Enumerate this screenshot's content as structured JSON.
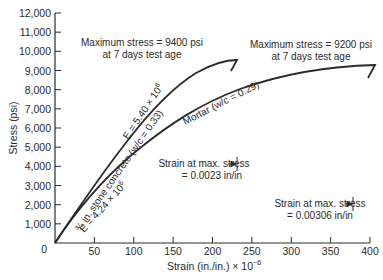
{
  "chart_data": {
    "type": "line",
    "title": "",
    "xlabel": "Strain (in./in.) × 10⁻⁶",
    "xlabel_base": "Strain (in./in.) × 10",
    "xlabel_exp": "−6",
    "ylabel": "Stress (psi)",
    "xlim": [
      0,
      400
    ],
    "ylim": [
      0,
      12000
    ],
    "grid": false,
    "x_ticks": [
      0,
      50,
      100,
      150,
      200,
      250,
      300,
      350,
      400
    ],
    "x_tick_labels": [
      "0",
      "50",
      "100",
      "150",
      "200",
      "250",
      "300",
      "350",
      "400"
    ],
    "y_ticks": [
      0,
      1000,
      2000,
      3000,
      4000,
      5000,
      6000,
      7000,
      8000,
      9000,
      10000,
      11000,
      12000
    ],
    "y_tick_labels": [
      "0",
      "1,000",
      "2,000",
      "3,000",
      "4,000",
      "5,000",
      "6,000",
      "7,000",
      "8,000",
      "9,000",
      "10,000",
      "11,000",
      "12,000"
    ],
    "series": [
      {
        "name": "3/4 in. stone concrete (w/c = 0.33)",
        "modulus_label": "E = 5.40 × 10⁶",
        "x": [
          0,
          10,
          25,
          50,
          75,
          100,
          125,
          150,
          175,
          200,
          215,
          230
        ],
        "y": [
          0,
          600,
          1300,
          2900,
          4400,
          5800,
          6900,
          7900,
          8600,
          9100,
          9300,
          9400
        ],
        "max_stress_label": "Maximum stress = 9400 psi",
        "age_label": "at 7 days test age",
        "strain_at_max_label": "Strain at max. stress",
        "strain_at_max_value": "= 0.0023 in/in"
      },
      {
        "name": "Mortar (w/c = 0.29)",
        "modulus_label": "E = 4.24 × 10⁶",
        "x": [
          0,
          10,
          25,
          50,
          75,
          100,
          125,
          150,
          175,
          200,
          250,
          300,
          340,
          365
        ],
        "y": [
          0,
          600,
          1300,
          2400,
          3500,
          4500,
          5400,
          6200,
          6800,
          7400,
          8300,
          8900,
          9100,
          9200
        ],
        "max_stress_label": "Maximum stress = 9200 psi",
        "age_label": "at 7 days test age",
        "strain_at_max_label": "Strain at max. stress",
        "strain_at_max_value": "= 0.00306 in/in"
      }
    ],
    "annotations": [
      "Maximum stress = 9400 psi at 7 days test age",
      "Maximum stress = 9200 psi at 7 days test age",
      "Strain at max. stress = 0.0023 in/in",
      "Strain at max. stress = 0.00306 in/in",
      "E = 5.40 × 10⁶",
      "E = 4.24 × 10⁶",
      "3/4 in. stone concrete (w/c = 0.33)",
      "Mortar (w/c = 0.29)"
    ]
  },
  "labels": {
    "concrete_curve": "¾ in. stone concrete (w/c = 0.33)",
    "concrete_E": "E = 5.40 × 10",
    "concrete_E_exp": "6",
    "mortar_curve": "Mortar (w/c = 0.29)",
    "mortar_E": "E = 4.24 × 10",
    "mortar_E_exp": "6",
    "concrete_max_line1": "Maximum stress = 9400 psi",
    "concrete_max_line2": "at 7 days test age",
    "mortar_max_line1": "Maximum stress = 9200 psi",
    "mortar_max_line2": "at 7 days test age",
    "concrete_strain_line1": "Strain at max. stress",
    "concrete_strain_line2": "= 0.0023 in/in",
    "mortar_strain_line1": "Strain at max. stress",
    "mortar_strain_line2": "= 0.00306 in/in"
  },
  "colors": {
    "ink": "#2a2a2a",
    "background": "#ffffff"
  }
}
